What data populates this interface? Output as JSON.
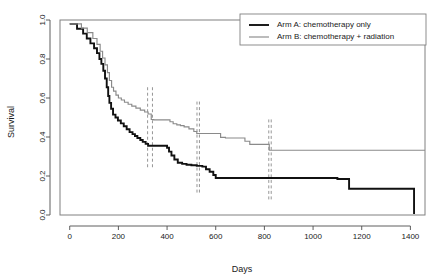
{
  "chart_data": {
    "type": "line",
    "title": "",
    "xlabel": "Days",
    "ylabel": "Survival",
    "xlim": [
      -40,
      1460
    ],
    "ylim": [
      0.0,
      1.0
    ],
    "grid": false,
    "legend_position": "top-right",
    "xticks": [
      0,
      200,
      400,
      600,
      800,
      1000,
      1200,
      1400
    ],
    "xtick_labels": [
      "0",
      "200",
      "400",
      "600",
      "800",
      "1000",
      "1200",
      "1400"
    ],
    "yticks": [
      0.0,
      0.2,
      0.4,
      0.6,
      0.8,
      1.0
    ],
    "ytick_labels": [
      "0.0",
      "0.2",
      "0.4",
      "0.6",
      "0.8",
      "1.0"
    ],
    "series": [
      {
        "name": "Arm A: chemotherapy only",
        "color": "#111111",
        "width": 1.9,
        "style": "step",
        "x": [
          0,
          15,
          30,
          55,
          70,
          85,
          100,
          112,
          122,
          130,
          138,
          145,
          152,
          158,
          163,
          170,
          178,
          188,
          198,
          210,
          222,
          234,
          246,
          258,
          268,
          278,
          290,
          300,
          312,
          322,
          330,
          392,
          400,
          408,
          418,
          430,
          444,
          462,
          480,
          500,
          522,
          545,
          560,
          575,
          590,
          600,
          1095,
          1100,
          1140,
          1148,
          1410,
          1415
        ],
        "y": [
          0.98,
          0.98,
          0.955,
          0.93,
          0.905,
          0.88,
          0.855,
          0.83,
          0.8,
          0.775,
          0.74,
          0.7,
          0.655,
          0.61,
          0.575,
          0.545,
          0.515,
          0.5,
          0.485,
          0.47,
          0.455,
          0.44,
          0.425,
          0.415,
          0.405,
          0.395,
          0.385,
          0.375,
          0.365,
          0.355,
          0.355,
          0.355,
          0.345,
          0.325,
          0.305,
          0.285,
          0.268,
          0.262,
          0.258,
          0.255,
          0.252,
          0.248,
          0.235,
          0.222,
          0.205,
          0.19,
          0.19,
          0.185,
          0.185,
          0.135,
          0.135,
          0.005
        ]
      },
      {
        "name": "Arm B: chemotherapy + radiation",
        "color": "#8a8a8a",
        "width": 1.15,
        "style": "step",
        "x": [
          0,
          20,
          48,
          72,
          95,
          112,
          125,
          135,
          145,
          155,
          163,
          172,
          180,
          190,
          200,
          212,
          225,
          240,
          255,
          272,
          290,
          308,
          322,
          335,
          345,
          400,
          412,
          425,
          440,
          455,
          470,
          490,
          510,
          522,
          535,
          560,
          600,
          620,
          640,
          660,
          700,
          720,
          740,
          810,
          820,
          1460
        ],
        "y": [
          0.98,
          0.98,
          0.958,
          0.935,
          0.905,
          0.875,
          0.84,
          0.805,
          0.77,
          0.73,
          0.69,
          0.655,
          0.635,
          0.615,
          0.6,
          0.59,
          0.578,
          0.568,
          0.558,
          0.548,
          0.538,
          0.528,
          0.518,
          0.49,
          0.488,
          0.488,
          0.478,
          0.468,
          0.462,
          0.458,
          0.452,
          0.442,
          0.428,
          0.418,
          0.418,
          0.418,
          0.418,
          0.398,
          0.395,
          0.395,
          0.395,
          0.378,
          0.362,
          0.362,
          0.332,
          0.332
        ]
      }
    ],
    "reference_lines": [
      {
        "x": 320,
        "y0": 0.245,
        "y1": 0.665,
        "color": "#8a8a8a",
        "style": "dashed"
      },
      {
        "x": 340,
        "y0": 0.245,
        "y1": 0.665,
        "color": "#8a8a8a",
        "style": "dashed"
      },
      {
        "x": 523,
        "y0": 0.115,
        "y1": 0.585,
        "color": "#8a8a8a",
        "style": "dashed"
      },
      {
        "x": 533,
        "y0": 0.115,
        "y1": 0.585,
        "color": "#8a8a8a",
        "style": "dashed"
      },
      {
        "x": 818,
        "y0": 0.08,
        "y1": 0.49,
        "color": "#8a8a8a",
        "style": "dashed"
      },
      {
        "x": 828,
        "y0": 0.08,
        "y1": 0.49,
        "color": "#8a8a8a",
        "style": "dashed"
      }
    ],
    "legend_entries": [
      {
        "label": "Arm A: chemotherapy only",
        "color": "#111111",
        "width": 1.9
      },
      {
        "label": "Arm B: chemotherapy + radiation",
        "color": "#8a8a8a",
        "width": 1.15
      }
    ]
  }
}
